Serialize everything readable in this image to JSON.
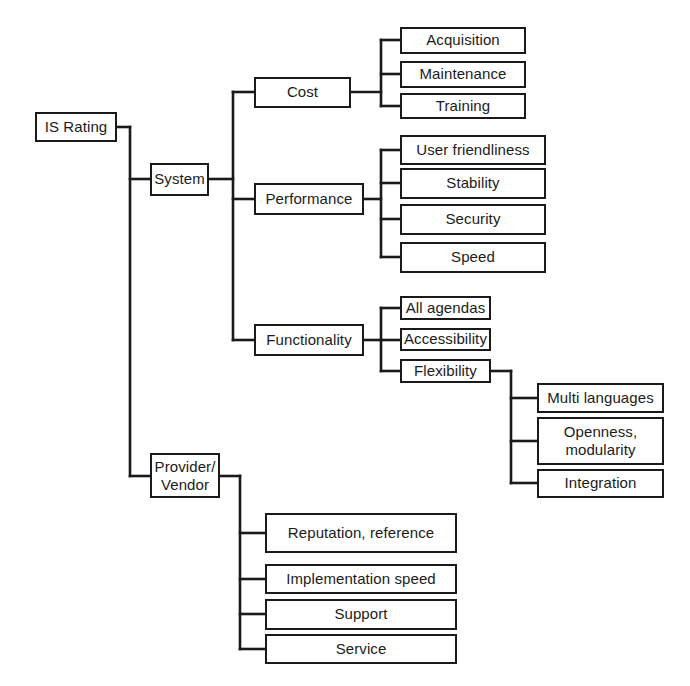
{
  "diagram": {
    "type": "hierarchy-tree",
    "orientation": "left-to-right",
    "line_color": "#1a1a1a",
    "box_fill": "#ffffff",
    "text_color": "#1b1b1b",
    "nodes": {
      "root": {
        "label": "IS Rating",
        "x": 35,
        "y": 112,
        "w": 82,
        "h": 30
      },
      "system": {
        "label": "System",
        "x": 150,
        "y": 163,
        "w": 59,
        "h": 33
      },
      "cost": {
        "label": "Cost",
        "x": 254,
        "y": 77,
        "w": 97,
        "h": 31
      },
      "acquisition": {
        "label": "Acquisition",
        "x": 400,
        "y": 27,
        "w": 126,
        "h": 27
      },
      "maintenance": {
        "label": "Maintenance",
        "x": 400,
        "y": 61,
        "w": 126,
        "h": 27
      },
      "training": {
        "label": "Training",
        "x": 400,
        "y": 93,
        "w": 126,
        "h": 26
      },
      "performance": {
        "label": "Performance",
        "x": 254,
        "y": 183,
        "w": 110,
        "h": 32
      },
      "user_friendliness": {
        "label": "User friendliness",
        "x": 400,
        "y": 135,
        "w": 146,
        "h": 30
      },
      "stability": {
        "label": "Stability",
        "x": 400,
        "y": 168,
        "w": 146,
        "h": 31
      },
      "security": {
        "label": "Security",
        "x": 400,
        "y": 204,
        "w": 146,
        "h": 31
      },
      "speed": {
        "label": "Speed",
        "x": 400,
        "y": 242,
        "w": 146,
        "h": 31
      },
      "functionality": {
        "label": "Functionality",
        "x": 254,
        "y": 324,
        "w": 110,
        "h": 32
      },
      "all_agendas": {
        "label": "All agendas",
        "x": 400,
        "y": 296,
        "w": 91,
        "h": 24
      },
      "accessibility": {
        "label": "Accessibility",
        "x": 400,
        "y": 328,
        "w": 91,
        "h": 23
      },
      "flexibility": {
        "label": "Flexibility",
        "x": 400,
        "y": 359,
        "w": 91,
        "h": 24
      },
      "multi_languages": {
        "label": "Multi languages",
        "x": 537,
        "y": 383,
        "w": 127,
        "h": 30
      },
      "openness_modularity": {
        "label": "Openness,\nmodularity",
        "x": 537,
        "y": 417,
        "w": 127,
        "h": 48
      },
      "integration": {
        "label": "Integration",
        "x": 537,
        "y": 469,
        "w": 127,
        "h": 29
      },
      "provider_vendor": {
        "label": "Provider/\nVendor",
        "x": 150,
        "y": 453,
        "w": 70,
        "h": 45
      },
      "reputation_reference": {
        "label": "Reputation, reference",
        "x": 265,
        "y": 513,
        "w": 192,
        "h": 40
      },
      "implementation_speed": {
        "label": "Implementation speed",
        "x": 265,
        "y": 564,
        "w": 192,
        "h": 30
      },
      "support": {
        "label": "Support",
        "x": 265,
        "y": 599,
        "w": 192,
        "h": 31
      },
      "service": {
        "label": "Service",
        "x": 265,
        "y": 634,
        "w": 192,
        "h": 30
      }
    },
    "edges": {
      "root_trunk": {
        "x": 130,
        "y_top": 127,
        "y_bottom": 476
      },
      "root_stub_in": {
        "from_x": 117,
        "to_x": 130,
        "y": 127
      },
      "system_stub": {
        "from_x": 130,
        "to_x": 150,
        "y": 179
      },
      "provider_stub": {
        "from_x": 130,
        "to_x": 150,
        "y": 476
      },
      "system_trunk": {
        "x": 233,
        "y_top": 92,
        "y_bottom": 340
      },
      "system_out": {
        "from_x": 209,
        "to_x": 233,
        "y": 179
      },
      "cost_stub": {
        "from_x": 233,
        "to_x": 254,
        "y": 92
      },
      "performance_stub": {
        "from_x": 233,
        "to_x": 254,
        "y": 199
      },
      "functionality_stub": {
        "from_x": 233,
        "to_x": 254,
        "y": 340
      },
      "cost_trunk": {
        "x": 381,
        "y_top": 40,
        "y_bottom": 106
      },
      "cost_out": {
        "from_x": 351,
        "to_x": 381,
        "y": 92
      },
      "cost_children_stubs": [
        {
          "from_x": 381,
          "to_x": 400,
          "y": 40
        },
        {
          "from_x": 381,
          "to_x": 400,
          "y": 74
        },
        {
          "from_x": 381,
          "to_x": 400,
          "y": 106
        }
      ],
      "performance_trunk": {
        "x": 381,
        "y_top": 150,
        "y_bottom": 257
      },
      "performance_out": {
        "from_x": 364,
        "to_x": 381,
        "y": 199
      },
      "performance_children_stubs": [
        {
          "from_x": 381,
          "to_x": 400,
          "y": 150
        },
        {
          "from_x": 381,
          "to_x": 400,
          "y": 183
        },
        {
          "from_x": 381,
          "to_x": 400,
          "y": 219
        },
        {
          "from_x": 381,
          "to_x": 400,
          "y": 257
        }
      ],
      "functionality_trunk": {
        "x": 381,
        "y_top": 308,
        "y_bottom": 371
      },
      "functionality_out": {
        "from_x": 364,
        "to_x": 381,
        "y": 340
      },
      "functionality_children_stubs": [
        {
          "from_x": 381,
          "to_x": 400,
          "y": 308
        },
        {
          "from_x": 381,
          "to_x": 400,
          "y": 340
        },
        {
          "from_x": 381,
          "to_x": 400,
          "y": 371
        }
      ],
      "flexibility_trunk": {
        "x": 511,
        "y_top": 371,
        "y_bottom": 483
      },
      "flexibility_out": {
        "from_x": 491,
        "to_x": 511,
        "y": 371
      },
      "flexibility_children_stubs": [
        {
          "from_x": 511,
          "to_x": 537,
          "y": 398
        },
        {
          "from_x": 511,
          "to_x": 537,
          "y": 441
        },
        {
          "from_x": 511,
          "to_x": 537,
          "y": 483
        }
      ],
      "provider_trunk": {
        "x": 240,
        "y_top": 476,
        "y_bottom": 649
      },
      "provider_out": {
        "from_x": 220,
        "to_x": 240,
        "y": 476
      },
      "provider_children_stubs": [
        {
          "from_x": 240,
          "to_x": 265,
          "y": 533
        },
        {
          "from_x": 240,
          "to_x": 265,
          "y": 579
        },
        {
          "from_x": 240,
          "to_x": 265,
          "y": 614
        },
        {
          "from_x": 240,
          "to_x": 265,
          "y": 649
        }
      ]
    }
  }
}
